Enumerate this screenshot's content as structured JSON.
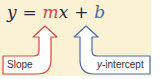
{
  "equation": {
    "y": "y",
    "equals": " = ",
    "m": "m",
    "x": "x",
    "plus": " + ",
    "b": "b"
  },
  "labels": {
    "slope": "Slope",
    "y_intercept_var": "y",
    "y_intercept_rest": "-intercept"
  },
  "colors": {
    "background": "#fbf2d6",
    "slope_arrow": "#d8453a",
    "intercept_arrow": "#4d6aa8",
    "text": "#2a2a3a"
  }
}
